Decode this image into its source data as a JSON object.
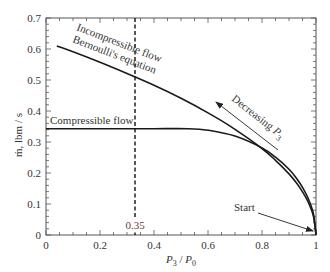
{
  "chart_data": {
    "type": "line",
    "title": "",
    "xlabel": "P3 / P0",
    "xlabel_parts": {
      "p3": "P",
      "p3_sub": "3",
      "sep": " / ",
      "p0": "P",
      "p0_sub": "0"
    },
    "ylabel": "m-dot, lbm / s",
    "ylabel_text": "ṁ, lbm / s",
    "xlim": [
      0,
      1
    ],
    "ylim": [
      0,
      0.7
    ],
    "xticks": [
      "0",
      "0.2",
      "0.4",
      "0.6",
      "0.8",
      "1"
    ],
    "xtick_values": [
      0,
      0.2,
      0.4,
      0.6,
      0.8,
      1.0
    ],
    "yticks": [
      "0",
      "0.1",
      "0.2",
      "0.3",
      "0.4",
      "0.5",
      "0.6",
      "0.7"
    ],
    "ytick_values": [
      0,
      0.1,
      0.2,
      0.3,
      0.4,
      0.5,
      0.6,
      0.7
    ],
    "grid": false,
    "series": [
      {
        "name": "Incompressible flow (Bernoulli's equation)",
        "x": [
          0.04,
          0.1,
          0.2,
          0.3,
          0.4,
          0.5,
          0.6,
          0.7,
          0.8,
          0.85,
          0.9,
          0.93,
          0.95,
          0.97,
          0.99,
          1.0
        ],
        "y": [
          0.61,
          0.591,
          0.557,
          0.521,
          0.483,
          0.441,
          0.394,
          0.341,
          0.279,
          0.241,
          0.197,
          0.165,
          0.139,
          0.108,
          0.062,
          0.0
        ]
      },
      {
        "name": "Compressible flow",
        "x": [
          0.0,
          0.1,
          0.2,
          0.3,
          0.4,
          0.528,
          0.6,
          0.7,
          0.8,
          0.85,
          0.9,
          0.93,
          0.95,
          0.97,
          0.99,
          1.0
        ],
        "y": [
          0.343,
          0.343,
          0.343,
          0.343,
          0.343,
          0.343,
          0.338,
          0.319,
          0.281,
          0.251,
          0.212,
          0.18,
          0.154,
          0.12,
          0.07,
          0.0
        ]
      }
    ],
    "annotations": [
      {
        "text": "Incompressible flow",
        "type": "curve-label"
      },
      {
        "text": "Bernoulli's equation",
        "type": "curve-label"
      },
      {
        "text": "Compressible flow",
        "type": "curve-label"
      },
      {
        "text": "Decreasing P3",
        "type": "arrow-label"
      },
      {
        "text": "Start",
        "type": "arrow-label"
      },
      {
        "text": "0.35",
        "type": "vertical-dashed-line",
        "x": 0.33
      }
    ],
    "legend": "none"
  },
  "labels": {
    "incompressible": "Incompressible flow",
    "bernoulli": "Bernoulli's equation",
    "compressible": "Compressible flow",
    "decreasing": "Decreasing ",
    "decreasing_p": "P",
    "decreasing_sub": "3",
    "start": "Start",
    "dashed_value": "0.35"
  },
  "colors": {
    "axis": "#555555",
    "curve": "#1a1a1a",
    "dashed_label": "#6b3a3a"
  }
}
